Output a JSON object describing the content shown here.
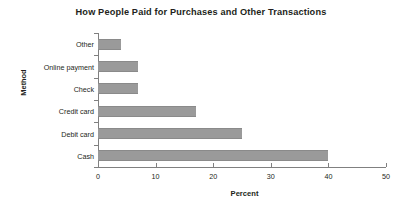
{
  "chart_data": {
    "type": "bar",
    "orientation": "horizontal",
    "title": "How People Paid for Purchases and Other Transactions",
    "xlabel": "Percent",
    "ylabel": "Method",
    "categories": [
      "Cash",
      "Debit card",
      "Credit card",
      "Check",
      "Online payment",
      "Other"
    ],
    "values": [
      40,
      25,
      17,
      7,
      7,
      4
    ],
    "xlim": [
      0,
      50
    ],
    "xticks": [
      0,
      10,
      20,
      30,
      40,
      50
    ],
    "xtick_labels": [
      "0",
      "10",
      "20",
      "30",
      "40",
      "50"
    ],
    "grid": false,
    "legend": null,
    "bar_color": "#9a9a9a",
    "axis_color": "#808080",
    "text_color": "#231f20",
    "background": "#ffffff"
  }
}
